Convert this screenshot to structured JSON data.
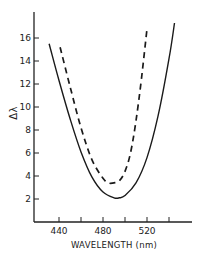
{
  "chart_data": {
    "type": "line",
    "title": "",
    "xlabel": "WAVELENGTH (nm)",
    "ylabel": "Δλ",
    "xlim": [
      420,
      560
    ],
    "ylim": [
      0,
      18
    ],
    "x_ticks": [
      440,
      460,
      480,
      500,
      520,
      540
    ],
    "x_tick_labels": [
      "440",
      "",
      "480",
      "",
      "520",
      ""
    ],
    "y_ticks": [
      2,
      4,
      6,
      8,
      10,
      12,
      14,
      16
    ],
    "y_tick_labels": [
      "2",
      "4",
      "6",
      "8",
      "10",
      "12",
      "14",
      "16"
    ],
    "grid": false,
    "legend": null,
    "series": [
      {
        "name": "solid",
        "style": "solid",
        "x": [
          431,
          440,
          450,
          460,
          470,
          480,
          490,
          495,
          500,
          510,
          520,
          530,
          540,
          545
        ],
        "values": [
          15.5,
          12.3,
          9.0,
          6.1,
          3.9,
          2.6,
          2.1,
          2.1,
          2.3,
          3.4,
          5.6,
          9.2,
          14.2,
          17.3
        ]
      },
      {
        "name": "dashed",
        "style": "dashed",
        "x": [
          441,
          450,
          460,
          470,
          480,
          485,
          490,
          495,
          500,
          505,
          510,
          515,
          520
        ],
        "values": [
          15.2,
          11.8,
          8.2,
          5.4,
          3.8,
          3.4,
          3.4,
          3.6,
          4.4,
          6.0,
          8.8,
          12.5,
          16.8
        ]
      }
    ]
  }
}
